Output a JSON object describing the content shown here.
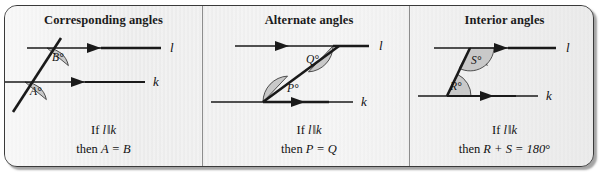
{
  "figure": {
    "kind": "geometry-reference-card",
    "background_color": "#eeeeee",
    "border_color": "#3a3a3a",
    "line_color": "#1a1a1a",
    "arc_fill_color": "#c9c9c9",
    "divider_color": "#8d8d8d",
    "panels": [
      {
        "id": "corresponding",
        "title": "Corresponding angles",
        "line_labels": {
          "upper": "l",
          "lower": "k"
        },
        "angle_labels": [
          "B°",
          "A°"
        ],
        "caption_line1_prefix": "If ",
        "caption_line1_left": "l",
        "caption_line1_symbol": "‖",
        "caption_line1_right": "k",
        "caption_line2_prefix": "then ",
        "caption_line2_body": "A = B",
        "caption_line2_suffix": ""
      },
      {
        "id": "alternate",
        "title": "Alternate angles",
        "line_labels": {
          "upper": "l",
          "lower": "k"
        },
        "angle_labels": [
          "Q°",
          "P°"
        ],
        "caption_line1_prefix": "If ",
        "caption_line1_left": "l",
        "caption_line1_symbol": "‖",
        "caption_line1_right": "k",
        "caption_line2_prefix": "then ",
        "caption_line2_body": "P = Q",
        "caption_line2_suffix": ""
      },
      {
        "id": "interior",
        "title": "Interior angles",
        "line_labels": {
          "upper": "l",
          "lower": "k"
        },
        "angle_labels": [
          "S°",
          "R°"
        ],
        "caption_line1_prefix": "If ",
        "caption_line1_left": "l",
        "caption_line1_symbol": "‖",
        "caption_line1_right": "k",
        "caption_line2_prefix": "then ",
        "caption_line2_body": "R + S = 180",
        "caption_line2_suffix": "°"
      }
    ]
  }
}
